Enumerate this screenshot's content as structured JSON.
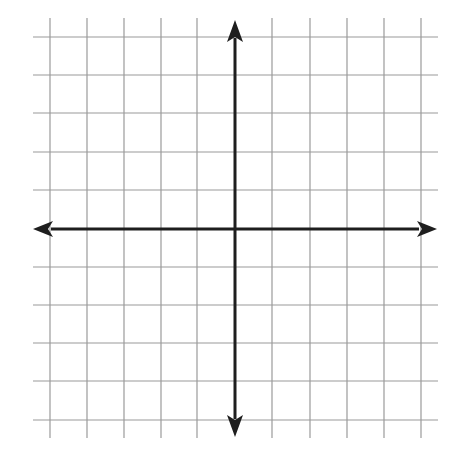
{
  "diagram": {
    "type": "coordinate-plane",
    "colors": {
      "background": "#ffffff",
      "grid": "#9a9a9a",
      "axis": "#1e1e1e"
    },
    "grid": {
      "x_lines": [
        50,
        87,
        124,
        161,
        197,
        272,
        310,
        347,
        384,
        421
      ],
      "y_lines": [
        37,
        75,
        113,
        152,
        190,
        267,
        305,
        343,
        381,
        420
      ],
      "x_extent": [
        33,
        438
      ],
      "y_extent": [
        18,
        438
      ]
    },
    "axes": {
      "origin": [
        235,
        229
      ],
      "x_axis": {
        "from": 33,
        "to": 437,
        "arrows": [
          "left",
          "right"
        ]
      },
      "y_axis": {
        "from": 20,
        "to": 437,
        "arrows": [
          "up",
          "down"
        ]
      }
    }
  },
  "chart_data": {
    "type": "line",
    "title": "",
    "xlabel": "",
    "ylabel": "",
    "grid": true,
    "xlim": [
      -5,
      5
    ],
    "ylim": [
      -5,
      5
    ],
    "x_gridlines": [
      -5,
      -4,
      -3,
      -2,
      -1,
      0,
      1,
      2,
      3,
      4,
      5
    ],
    "y_gridlines": [
      -5,
      -4,
      -3,
      -2,
      -1,
      0,
      1,
      2,
      3,
      4,
      5
    ],
    "series": []
  }
}
